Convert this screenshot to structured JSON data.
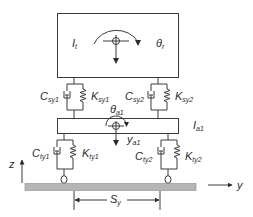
{
  "diagram": {
    "type": "mechanical-model",
    "colors": {
      "line": "#3a3a3a",
      "ground": "#b5b5b5",
      "text": "#2a2a2a",
      "background": "#ffffff"
    },
    "body": {
      "inertia_label": {
        "main": "I",
        "sub": "t"
      },
      "rotation_label": {
        "main": "θ",
        "sub": "r"
      }
    },
    "axle": {
      "inertia_label": {
        "main": "I",
        "sub": "a1"
      },
      "rotation_label": {
        "main": "θ",
        "sub": "a1"
      },
      "displacement_label": {
        "main": "y",
        "sub": "a1"
      }
    },
    "secondary_suspension": {
      "left": {
        "damper": {
          "main": "C",
          "sub": "sy1"
        },
        "spring": {
          "main": "K",
          "sub": "sy1"
        }
      },
      "right": {
        "damper": {
          "main": "C",
          "sub": "sy2"
        },
        "spring": {
          "main": "K",
          "sub": "sy2"
        }
      }
    },
    "primary_suspension": {
      "left": {
        "damper": {
          "main": "C",
          "sub": "ty1"
        },
        "spring": {
          "main": "K",
          "sub": "ty1"
        }
      },
      "right": {
        "damper": {
          "main": "C",
          "sub": "ty2"
        },
        "spring": {
          "main": "K",
          "sub": "ty2"
        }
      }
    },
    "axes": {
      "vertical": "z",
      "horizontal": "y"
    },
    "dimension": {
      "main": "S",
      "sub": "y"
    }
  }
}
